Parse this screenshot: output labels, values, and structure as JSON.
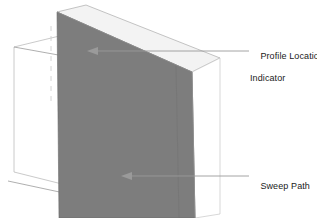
{
  "figure": {
    "type": "technical-illustration",
    "background_color": "#ffffff",
    "width": 317,
    "height": 218
  },
  "geometry": {
    "swept_solid": {
      "name": "swept-solid",
      "front_face_fill": "#7d7d7d",
      "side_face_fill": "#757575",
      "edge_color": "#5f5f5f",
      "front_face_points": "57,12 192,72 195,218 59,218",
      "side_face_points": "192,72 219,58 219,214 195,218",
      "top_face_points": "57,12 85,5 219,58 192,72"
    },
    "profile_plane": {
      "name": "profile-plane",
      "fill": "none",
      "stroke": "#b4b4b4",
      "points": "14,47 76,32 78,188 14,172"
    },
    "profile_location_line": {
      "name": "profile-location-dashed-line",
      "stroke": "#c8c8c8",
      "dash": "4 4",
      "x": 51,
      "y1": 26,
      "y2": 104
    },
    "sweep_path_line": {
      "name": "sweep-path-polyline",
      "stroke": "#8c8c8c",
      "points": "10,180 125,205 125,67 14,47"
    }
  },
  "callouts": [
    {
      "id": "profile-location",
      "label_line1": "Profile Location",
      "label_line2": "Indicator",
      "leader_color": "#9a9a9a",
      "arrow_tip_x": 88,
      "arrow_tip_y": 51,
      "leader_end_x": 249,
      "leader_y": 51
    },
    {
      "id": "sweep-path",
      "label_line1": "Sweep Path",
      "label_line2": "",
      "leader_color": "#9a9a9a",
      "arrow_tip_x": 122,
      "arrow_tip_y": 176,
      "leader_end_x": 249,
      "leader_y": 176
    }
  ],
  "colors": {
    "solid_gray": "#7d7d7d",
    "leader_gray": "#9a9a9a",
    "outline_gray": "#b4b4b4",
    "text_black": "#1a1a1a"
  }
}
